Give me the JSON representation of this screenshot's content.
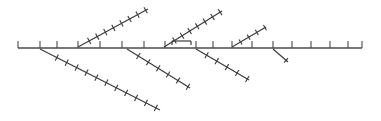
{
  "chart_data": {
    "type": "line",
    "title": "",
    "subtitle": "",
    "xlabel": "",
    "ylabel": "",
    "grid": false,
    "legend_position": "none",
    "colors": {
      "spine": "#4a4a4a",
      "branch": "#3c3c3c",
      "background": "#ffffff"
    },
    "canvas": {
      "width": 381,
      "height": 121
    },
    "spine": {
      "name": "main-spine",
      "x1": 18,
      "y1": 48,
      "x2": 362,
      "y2": 48,
      "tick_length": 7,
      "tick_side": "up",
      "tick_positions": [
        18,
        40,
        57,
        78,
        100,
        122,
        144,
        165,
        196,
        213,
        232,
        252,
        273,
        292,
        311,
        330,
        348,
        362
      ]
    },
    "branches": [
      {
        "name": "upper-branch-1",
        "direction": "up-right",
        "x1": 78,
        "y1": 47,
        "x2": 148,
        "y2": 9,
        "tick_count": 8,
        "tick_length": 7,
        "tick_start_fraction": 0.16
      },
      {
        "name": "upper-branch-2",
        "direction": "up-right",
        "x1": 164,
        "y1": 47,
        "x2": 222,
        "y2": 11,
        "tick_count": 7,
        "tick_length": 7,
        "tick_start_fraction": 0.18
      },
      {
        "name": "upper-branch-3",
        "direction": "up-right",
        "x1": 232,
        "y1": 47,
        "x2": 266,
        "y2": 27,
        "tick_count": 4,
        "tick_length": 6,
        "tick_start_fraction": 0.25
      },
      {
        "name": "lower-branch-1",
        "direction": "down-right",
        "x1": 40,
        "y1": 49,
        "x2": 160,
        "y2": 110,
        "tick_count": 11,
        "tick_length": 7,
        "tick_start_fraction": 0.14
      },
      {
        "name": "lower-branch-2",
        "direction": "down-right",
        "x1": 127,
        "y1": 49,
        "x2": 190,
        "y2": 88,
        "tick_count": 6,
        "tick_length": 7,
        "tick_start_fraction": 0.18
      },
      {
        "name": "lower-branch-3",
        "direction": "down-right",
        "x1": 196,
        "y1": 49,
        "x2": 249,
        "y2": 80,
        "tick_count": 5,
        "tick_length": 7,
        "tick_start_fraction": 0.2
      },
      {
        "name": "lower-branch-4-stub",
        "direction": "down-right",
        "x1": 273,
        "y1": 49,
        "x2": 288,
        "y2": 62,
        "tick_count": 1,
        "tick_length": 6,
        "tick_start_fraction": 0.75
      }
    ],
    "stubs": [
      {
        "name": "horizontal-stub",
        "x1": 172,
        "y1": 41,
        "x2": 191,
        "y2": 41,
        "end_caps": [
          "down",
          "down"
        ],
        "cap_length": 4
      }
    ]
  }
}
